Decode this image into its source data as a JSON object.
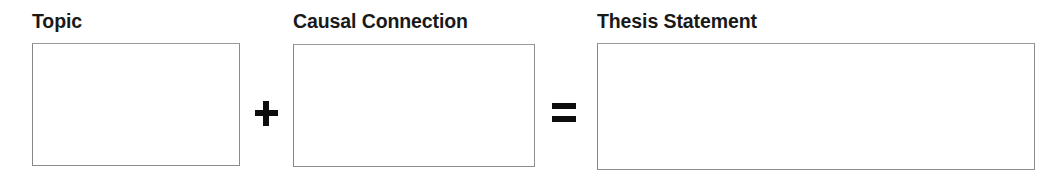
{
  "page": {
    "background_color": "#ffffff",
    "text_color": "#191919",
    "box_border_color": "#8c8c8c",
    "operator_color": "#0d0d0d"
  },
  "groups": [
    {
      "label": "Topic",
      "box_value": "",
      "box_placeholder": ""
    },
    {
      "label": "Causal Connection",
      "box_value": "",
      "box_placeholder": ""
    },
    {
      "label": "Thesis Statement",
      "box_value": "",
      "box_placeholder": ""
    }
  ],
  "operators": [
    {
      "symbol": "+",
      "name": "plus"
    },
    {
      "symbol": "=",
      "name": "equals"
    }
  ]
}
